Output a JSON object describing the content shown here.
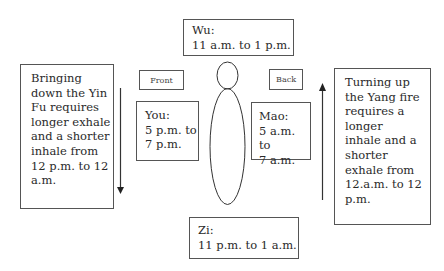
{
  "diagram": {
    "top_box": {
      "label": "Wu:",
      "time": "11 a.m. to 1 p.m."
    },
    "bottom_box": {
      "label": "Zi:",
      "time": "11 p.m. to 1 a.m."
    },
    "front_label": "Front",
    "back_label": "Back",
    "left_time_box": {
      "label": "You:",
      "time": "5 p.m. to\n7 p.m."
    },
    "right_time_box": {
      "label": "Mao:",
      "time": "5 a.m. to\n7 a.m."
    },
    "left_text": "Bringing\ndown the Yin\nFu requires\nlonger exhale\nand a shorter\ninhale from\n12 p.m. to 12\na.m.",
    "right_text": "Turning up\nthe Yang fire\nrequires a\nlonger\ninhale and a\nshorter\nexhale from\n12.a.m. to 12\np.m.",
    "left_arrow_direction": "down",
    "right_arrow_direction": "up",
    "line_color": "#333333"
  }
}
